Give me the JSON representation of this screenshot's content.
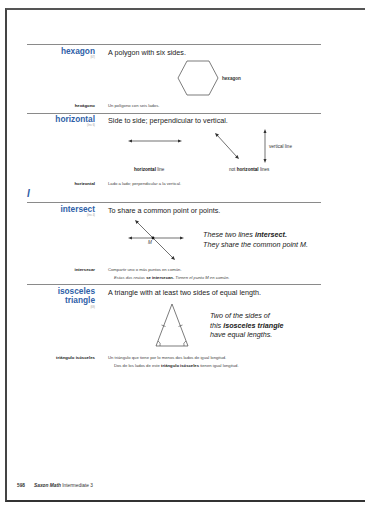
{
  "entries": [
    {
      "term": "hexagon",
      "ref": "(67)",
      "definition": "A polygon with six sides.",
      "figure_label": "hexagon",
      "spanish_term": "hexágono",
      "spanish_definition": "Un polígono con seis lados."
    },
    {
      "term": "horizontal",
      "ref": "(Inv. 6)",
      "definition": "Side to side; perpendicular to vertical.",
      "figure_labels": {
        "horizontal_bold": "horizontal",
        "horizontal_rest": " line",
        "not_prefix": "not ",
        "not_bold": "horizontal",
        "not_rest": " lines",
        "vertical": "vertical line"
      },
      "spanish_term": "horizontal",
      "spanish_definition": "Lado a lado; perpendicular a la vertical."
    },
    {
      "term": "intersect",
      "ref": "(Inv. 4)",
      "definition": "To share a common point or points.",
      "point_label": "M",
      "caption_line1_pre": "These two lines ",
      "caption_line1_bold": "intersect.",
      "caption_line2": "They share the common point M.",
      "spanish_term": "intersecar",
      "spanish_definition": "Compartir uno o más puntos en común.",
      "spanish_example_pre": "Estas dos rectas ",
      "spanish_example_bold": "se intersecan.",
      "spanish_example_post": " Tienen el punto M en común."
    },
    {
      "term_line1": "isosceles",
      "term_line2": "triangle",
      "ref": "(69)",
      "definition": "A triangle with at least two sides of equal length.",
      "caption_line1": "Two of the sides of",
      "caption_line2_pre": "this ",
      "caption_line2_bold": "isosceles triangle",
      "caption_line3": "have equal lengths.",
      "spanish_term": "triángulo isósceles",
      "spanish_definition": "Un triángulo que tiene por lo menos dos lados de igual longitud.",
      "spanish_example_pre": "Dos de los lados de este ",
      "spanish_example_bold": "triángulo isósceles",
      "spanish_example_post": " tienen igual longitud."
    }
  ],
  "section_letter": "I",
  "footer": {
    "page_number": "598",
    "brand": "Saxon Math",
    "subtitle": " Intermediate 3"
  },
  "colors": {
    "term_blue": "#2f5fa8",
    "rule_gray": "#8a8a8a"
  }
}
